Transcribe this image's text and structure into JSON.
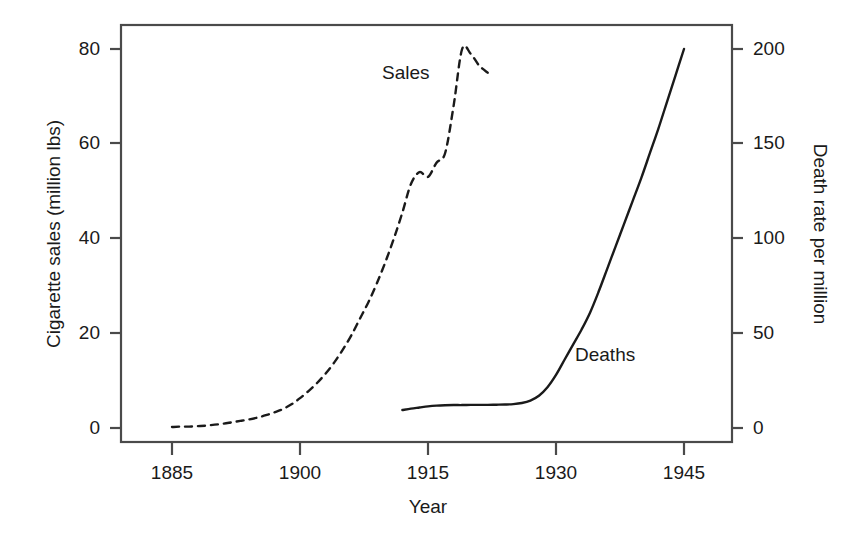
{
  "chart_data": {
    "type": "line",
    "title": "",
    "xlabel": "Year",
    "ylabel": "Cigarette sales (million lbs)",
    "ylabel_right": "Death rate per million",
    "xlim": [
      1879,
      1951
    ],
    "ylim": [
      -1.5,
      87
    ],
    "ylim_right": [
      -3.75,
      217.5
    ],
    "grid": false,
    "legend_position": "inline-annotations",
    "xticks": [
      1885,
      1900,
      1915,
      1930,
      1945
    ],
    "xticklabels": [
      "1885",
      "1900",
      "1915",
      "1930",
      "1945"
    ],
    "yticks_left": [
      0,
      20,
      40,
      60,
      80
    ],
    "yticklabels_left": [
      "0",
      "20",
      "40",
      "60",
      "80"
    ],
    "yticks_right": [
      0,
      50,
      100,
      150,
      200
    ],
    "yticklabels_right": [
      "0",
      "50",
      "100",
      "150",
      "200"
    ],
    "series": [
      {
        "name": "Sales",
        "label": "Sales",
        "axis": "left",
        "style": "dashed",
        "color": "#1a1a1a",
        "x": [
          1885,
          1886,
          1887,
          1888,
          1889,
          1890,
          1891,
          1892,
          1893,
          1894,
          1895,
          1896,
          1897,
          1898,
          1899,
          1900,
          1901,
          1902,
          1903,
          1904,
          1905,
          1906,
          1907,
          1908,
          1909,
          1910,
          1911,
          1912,
          1913,
          1914,
          1915,
          1916,
          1917,
          1918,
          1919,
          1920,
          1921,
          1922
        ],
        "values": [
          0.2,
          0.3,
          0.3,
          0.4,
          0.5,
          0.7,
          0.9,
          1.2,
          1.5,
          1.8,
          2.2,
          2.7,
          3.3,
          4.0,
          5.0,
          6.3,
          7.8,
          9.5,
          11.5,
          13.8,
          16.5,
          19.5,
          23.0,
          26.5,
          30.5,
          35.0,
          40.0,
          45.5,
          51.5,
          54.0,
          53.0,
          56.0,
          58.0,
          68.0,
          80.0,
          79.0,
          76.5,
          75.0
        ]
      },
      {
        "name": "Deaths",
        "label": "Deaths",
        "axis": "right",
        "style": "solid",
        "color": "#1a1a1a",
        "x": [
          1912,
          1913,
          1914,
          1915,
          1916,
          1917,
          1918,
          1919,
          1920,
          1921,
          1922,
          1923,
          1924,
          1925,
          1926,
          1927,
          1928,
          1929,
          1930,
          1931,
          1932,
          1933,
          1934,
          1935,
          1936,
          1937,
          1938,
          1939,
          1940,
          1941,
          1942,
          1943,
          1944,
          1945
        ],
        "values": [
          9.5,
          10.2,
          10.8,
          11.4,
          11.8,
          12.0,
          12.1,
          12.1,
          12.2,
          12.2,
          12.2,
          12.3,
          12.4,
          12.6,
          13.2,
          14.5,
          17.0,
          21.5,
          28.0,
          36.0,
          44.0,
          52.0,
          61.0,
          72.0,
          84.0,
          96.0,
          108.0,
          120.0,
          132.0,
          145.0,
          158.0,
          172.0,
          186.0,
          200.0
        ]
      }
    ],
    "annotations": [
      {
        "text": "Sales",
        "x": 1916,
        "y": 73
      },
      {
        "text": "Deaths",
        "x": 1938,
        "y": 20
      }
    ]
  },
  "axes": {
    "x_tick_labels": [
      "1885",
      "1900",
      "1915",
      "1930",
      "1945"
    ],
    "y_left_tick_labels": [
      "80",
      "60",
      "40",
      "20",
      "0"
    ],
    "y_right_tick_labels": [
      "200",
      "150",
      "100",
      "50",
      "0"
    ],
    "x_axis_title": "Year",
    "y_left_axis_title": "Cigarette sales (million lbs)",
    "y_right_axis_title": "Death rate per million"
  },
  "annotations": {
    "sales_label": "Sales",
    "deaths_label": "Deaths"
  },
  "colors": {
    "background": "#ffffff",
    "ink": "#1a1a1a",
    "axis": "#4a4a4a"
  }
}
